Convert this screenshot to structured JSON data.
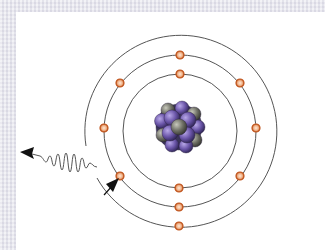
{
  "diagram": {
    "type": "atom-bohr-model",
    "colors": {
      "frame": "#e4e4ec",
      "panel": "#ffffff",
      "orbit": "#555555",
      "electron_fill": "#f4c7a6",
      "electron_stroke": "#c0541c",
      "proton": "#6a55a8",
      "neutron": "#6f7066",
      "arrow": "#111111",
      "photon": "#555555"
    },
    "nucleus": {
      "cx": 179,
      "cy": 127,
      "r": 23
    },
    "shells": [
      {
        "name": "inner-shell",
        "cx": 180,
        "cy": 131,
        "r": 57
      },
      {
        "name": "middle-shell",
        "cx": 180,
        "cy": 131,
        "r": 76
      },
      {
        "name": "outer-shell",
        "cx": 180,
        "cy": 130,
        "r": 96,
        "gap": true
      }
    ],
    "electrons": [
      {
        "shell": "inner",
        "x": 180,
        "y": 74
      },
      {
        "shell": "inner",
        "x": 179,
        "y": 188
      },
      {
        "shell": "middle",
        "x": 180,
        "y": 55
      },
      {
        "shell": "middle",
        "x": 240,
        "y": 83
      },
      {
        "shell": "middle",
        "x": 256,
        "y": 128
      },
      {
        "shell": "middle",
        "x": 240,
        "y": 176
      },
      {
        "shell": "middle",
        "x": 179,
        "y": 207
      },
      {
        "shell": "middle",
        "x": 120,
        "y": 176
      },
      {
        "shell": "middle",
        "x": 104,
        "y": 128
      },
      {
        "shell": "middle",
        "x": 120,
        "y": 83
      },
      {
        "shell": "outer",
        "x": 179,
        "y": 226
      }
    ],
    "transition_arrow": {
      "from": [
        104,
        194
      ],
      "to": [
        119,
        178
      ]
    },
    "photon": {
      "from": [
        97,
        167
      ],
      "to": [
        22,
        153
      ],
      "label": "emitted photon"
    }
  }
}
